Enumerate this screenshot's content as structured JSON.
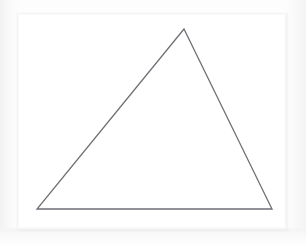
{
  "image": {
    "kind": "line-drawing",
    "subject": "triangle",
    "width": 306,
    "height": 248,
    "has_text": false,
    "background_color": "#fdfdfd",
    "surround_color": "#f3f3f4"
  },
  "paper": {
    "name": "paper-sheet",
    "fill_color": "#ffffff",
    "left": 17,
    "top": 13,
    "width": 270,
    "height": 217
  },
  "shape": {
    "name": "triangle",
    "type": "polygon",
    "sides": 3,
    "stroke_color": "#6e6e76",
    "stroke_width": 1.3,
    "fill": "none",
    "closed": true,
    "vertices": [
      {
        "label": "apex",
        "x": 184,
        "y": 29
      },
      {
        "label": "bottom-right",
        "x": 272,
        "y": 209
      },
      {
        "label": "bottom-left",
        "x": 37,
        "y": 209
      }
    ],
    "points_attr": "184,29 272,209 37,209",
    "edges": [
      {
        "label": "left-side",
        "from": "bottom-left",
        "to": "apex"
      },
      {
        "label": "right-side",
        "from": "apex",
        "to": "bottom-right"
      },
      {
        "label": "base",
        "from": "bottom-right",
        "to": "bottom-left"
      }
    ]
  }
}
